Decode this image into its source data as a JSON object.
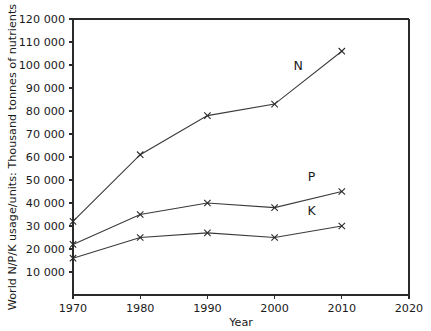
{
  "chart_data": {
    "type": "line",
    "title": "",
    "xlabel": "Year",
    "ylabel": "World N/P/K usage/units: Thousand tonnes of nutrients",
    "x": [
      1970,
      1980,
      1990,
      2000,
      2010
    ],
    "xlim": [
      1970,
      2020
    ],
    "ylim": [
      0,
      120000
    ],
    "xticks": [
      "1970",
      "1980",
      "1990",
      "2000",
      "2010",
      "2020"
    ],
    "yticks": [
      "10000",
      "20000",
      "30000",
      "40000",
      "50000",
      "60000",
      "70000",
      "80000",
      "90000",
      "100000",
      "110000",
      "120000"
    ],
    "grid": false,
    "legend_position": "inline-annotations",
    "marker": "x",
    "series": [
      {
        "name": "N",
        "label": "N",
        "values": [
          32000,
          61000,
          78000,
          83000,
          106000
        ]
      },
      {
        "name": "P",
        "label": "P",
        "values": [
          22000,
          35000,
          40000,
          38000,
          45000
        ]
      },
      {
        "name": "K",
        "label": "K",
        "values": [
          16000,
          25000,
          27000,
          25000,
          30000
        ]
      }
    ],
    "annotations": [
      {
        "text": "N",
        "x": 2003.5,
        "y": 98000
      },
      {
        "text": "P",
        "x": 2005.5,
        "y": 49500
      },
      {
        "text": "K",
        "x": 2005.5,
        "y": 35000
      }
    ],
    "colors": {
      "line": "#3a3a3a",
      "axis": "#2a2a2a",
      "text": "#1b1b1b",
      "background": "#ffffff"
    }
  }
}
